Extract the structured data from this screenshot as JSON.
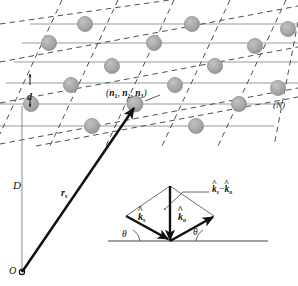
{
  "figure": {
    "background_color": "#ffffff"
  },
  "colors": {
    "atom_fill": "#a8a8a8",
    "atom_edge": "#8f8f8f",
    "lattice_line": "#9a9a9a",
    "dashed_line": "#4a4a4a",
    "vector_stroke": "#111111",
    "thin_stroke": "#555555",
    "text": "#111111"
  },
  "lattice": {
    "row_count": 6,
    "lattice_line_label": "(N)",
    "spacing_label": "d",
    "distance_label": "D",
    "site_index_label": "(n1, n2, n3)",
    "site_index_parts": {
      "open": "(",
      "n": "n",
      "i1": "1",
      "sep1": ", ",
      "i2": "2",
      "sep2": ", ",
      "i3": "3",
      "close": ")"
    }
  },
  "vectors": {
    "position_vector_label": "rs",
    "position_vector_base": "r",
    "position_vector_sub": "s",
    "origin_label": "O"
  },
  "inset": {
    "scattering_vector_label": "ks - ko",
    "k_symbol": "k",
    "hat_symbol": "^",
    "minus_symbol": "−",
    "scattered_sub": "s",
    "incident_sub": "o",
    "scattered_unit_label": "ks",
    "incident_unit_label": "ko",
    "angle_label_left": "θ",
    "angle_label_right": "θ"
  }
}
